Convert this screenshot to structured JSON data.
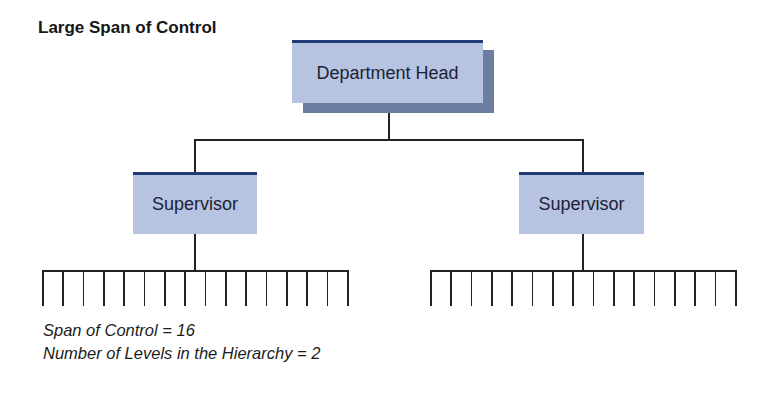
{
  "title": "Large Span of Control",
  "nodes": {
    "head": {
      "label": "Department Head"
    },
    "supervisors": [
      {
        "label": "Supervisor"
      },
      {
        "label": "Supervisor"
      }
    ]
  },
  "subordinates_per_supervisor": 16,
  "captions": {
    "span": "Span of Control = 16",
    "levels": "Number of Levels in the Hierarchy = 2"
  },
  "colors": {
    "box_fill": "#b6c4e1",
    "box_top_border": "#1f3d73",
    "shadow": "#6b7ea2",
    "line": "#222222"
  }
}
